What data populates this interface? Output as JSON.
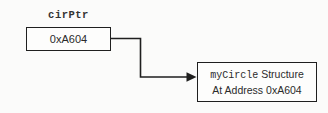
{
  "diagram": {
    "pointer_label": "cirPtr",
    "pointer_value": "0xA604",
    "struct_line1_code": "myCircle",
    "struct_line1_text": " Structure",
    "struct_line2": "At Address 0xA604"
  },
  "colors": {
    "line": "#1f1f1f",
    "text": "#2b2b2b",
    "background": "#fbfbfa"
  }
}
